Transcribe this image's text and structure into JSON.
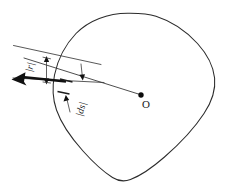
{
  "figure": {
    "background_color": "#ffffff",
    "stroke_color": "#2b2b2b",
    "accent_color": "#111111",
    "width": 229,
    "height": 190
  },
  "labels": {
    "radius_vector": "|r|",
    "surface_element": "|ds|",
    "origin": "O"
  },
  "elements": {
    "closed_curve_name": "closed-curve",
    "radial_line_name": "radial-line",
    "origin_point_name": "origin-point",
    "arrow_name": "radial-arrow",
    "strip_upper_name": "strip-upper-edge",
    "strip_lower_name": "strip-lower-edge",
    "dimension_r_name": "dimension-r",
    "dimension_ds_name": "dimension-ds"
  },
  "geometry": {
    "origin_x": 141,
    "origin_y": 95,
    "arrow_tip_x": 13,
    "arrow_tip_y": 79,
    "curve_top_y": 13,
    "curve_right_x": 215,
    "curve_bottom_y": 181
  }
}
